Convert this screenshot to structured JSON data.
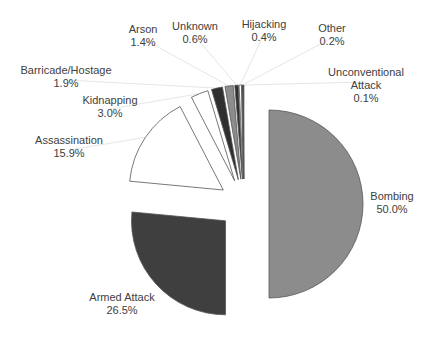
{
  "chart_data": {
    "type": "pie",
    "title": "",
    "exploded": true,
    "start_angle_deg": 0,
    "direction": "clockwise",
    "slices": [
      {
        "label": "Bombing",
        "value": 50.0,
        "display": "50.0%",
        "color": "#8c8c8c"
      },
      {
        "label": "Armed Attack",
        "value": 26.5,
        "display": "26.5%",
        "color": "#3f3f3f"
      },
      {
        "label": "Assassination",
        "value": 15.9,
        "display": "15.9%",
        "color": "#ffffff"
      },
      {
        "label": "Kidnapping",
        "value": 3.0,
        "display": "3.0%",
        "color": "#ffffff"
      },
      {
        "label": "Barricade/Hostage",
        "value": 1.9,
        "display": "1.9%",
        "color": "#2f2f2f"
      },
      {
        "label": "Arson",
        "value": 1.4,
        "display": "1.4%",
        "color": "#8c8c8c"
      },
      {
        "label": "Unknown",
        "value": 0.6,
        "display": "0.6%",
        "color": "#2f2f2f"
      },
      {
        "label": "Hijacking",
        "value": 0.4,
        "display": "0.4%",
        "color": "#ffffff"
      },
      {
        "label": "Other",
        "value": 0.2,
        "display": "0.2%",
        "color": "#3f3f3f"
      },
      {
        "label": "Unconventional Attack",
        "value": 0.1,
        "display": "0.1%",
        "color": "#1f1f1f"
      }
    ],
    "legend": "none (direct labels with leader lines)"
  },
  "labels": [
    {
      "name": "Bombing",
      "pct": "50.0%",
      "x": 392,
      "y": 196
    },
    {
      "name": "Armed Attack",
      "pct": "26.5%",
      "x": 122,
      "y": 297
    },
    {
      "name": "Assassination",
      "pct": "15.9%",
      "x": 69,
      "y": 136
    },
    {
      "name": "Kidnapping",
      "pct": "3.0%",
      "x": 110,
      "y": 95
    },
    {
      "name": "Barricade/Hostage",
      "pct": "1.9%",
      "x": 66,
      "y": 66
    },
    {
      "name": "Arson",
      "pct": "1.4%",
      "x": 143,
      "y": 25
    },
    {
      "name": "Unknown",
      "pct": "0.6%",
      "x": 195,
      "y": 22
    },
    {
      "name": "Hijacking",
      "pct": "0.4%",
      "x": 264,
      "y": 20
    },
    {
      "name": "Other",
      "pct": "0.2%",
      "x": 332,
      "y": 24
    },
    {
      "name": "Unconventional",
      "name2": "Attack",
      "pct": "0.1%",
      "x": 366,
      "y": 68
    }
  ]
}
